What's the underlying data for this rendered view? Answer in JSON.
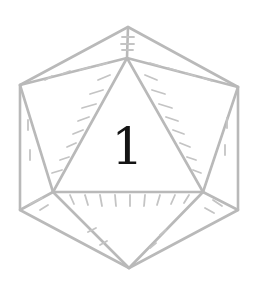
{
  "die": {
    "type": "d20-icosahedron",
    "face_value": "1",
    "edge_color": "#b9b9b9",
    "numeral_color": "#141414",
    "background": "#ffffff"
  }
}
